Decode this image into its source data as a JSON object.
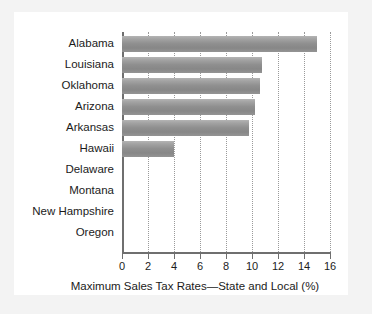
{
  "chart_data": {
    "type": "bar",
    "orientation": "horizontal",
    "title": "",
    "xlabel": "Maximum Sales Tax Rates—State and Local (%)",
    "ylabel": "",
    "categories": [
      "Alabama",
      "Louisiana",
      "Oklahoma",
      "Arizona",
      "Arkansas",
      "Hawaii",
      "Delaware",
      "Montana",
      "New Hampshire",
      "Oregon"
    ],
    "values": [
      15.0,
      10.8,
      10.6,
      10.2,
      9.8,
      4.0,
      0,
      0,
      0,
      0
    ],
    "xlim": [
      0,
      16
    ],
    "xticks": [
      0,
      2,
      4,
      6,
      8,
      10,
      12,
      14,
      16
    ],
    "xticklabels": [
      "0",
      "2",
      "4",
      "6",
      "8",
      "10",
      "12",
      "14",
      "16"
    ],
    "grid": "vertical-dotted",
    "legend": "none",
    "bar_color": "#949494",
    "gridline_color": "#9a9a9a",
    "axis_color": "#6f6f6f",
    "text_color": "#1b1b1b",
    "panel_background": "#ffffff",
    "figure_background": "#f3f3f3"
  }
}
